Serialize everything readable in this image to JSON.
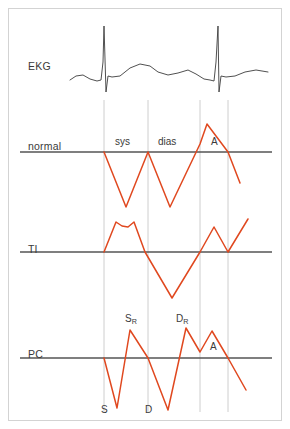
{
  "figure": {
    "width": 290,
    "height": 429,
    "background": "#ffffff",
    "frame_color": "#d3d3d3",
    "baseline_color": "#555555",
    "gridline_color": "#c8c8c8",
    "ekg_color": "#3c3c3c",
    "trace_color": "#e0481f"
  },
  "rows": [
    {
      "id": "ekg",
      "label": "EKG",
      "label_x": 28,
      "label_y": 60,
      "baseline_y": 0
    },
    {
      "id": "normal",
      "label": "normal",
      "label_x": 28,
      "label_y": 140,
      "baseline_y": 152
    },
    {
      "id": "ti",
      "label": "TI",
      "label_x": 28,
      "label_y": 243,
      "baseline_y": 252
    },
    {
      "id": "pc",
      "label": "PC",
      "label_x": 28,
      "label_y": 348,
      "baseline_y": 358
    }
  ],
  "gridlines": {
    "x_positions": [
      104,
      148,
      200,
      228
    ],
    "y_top": 100,
    "y_bottom": 412
  },
  "annotations": [
    {
      "id": "normal-sys",
      "text": "sys",
      "x": 115,
      "y": 136,
      "row": "normal",
      "sub": ""
    },
    {
      "id": "normal-dias",
      "text": "dias",
      "x": 158,
      "y": 136,
      "row": "normal",
      "sub": ""
    },
    {
      "id": "normal-a",
      "text": "A",
      "x": 211,
      "y": 136,
      "row": "normal",
      "sub": ""
    },
    {
      "id": "pc-sr",
      "text": "S",
      "x": 125,
      "y": 313,
      "row": "pc",
      "sub": "R"
    },
    {
      "id": "pc-dr",
      "text": "D",
      "x": 176,
      "y": 313,
      "row": "pc",
      "sub": "R"
    },
    {
      "id": "pc-a",
      "text": "A",
      "x": 210,
      "y": 341,
      "row": "pc",
      "sub": ""
    },
    {
      "id": "axis-s",
      "text": "S",
      "x": 101,
      "y": 404,
      "row": "axis",
      "sub": ""
    },
    {
      "id": "axis-d",
      "text": "D",
      "x": 145,
      "y": 404,
      "row": "axis",
      "sub": ""
    }
  ],
  "chart_data": {
    "type": "line",
    "xlabel": "",
    "ylabel": "",
    "grid": true,
    "legend": "none",
    "x_gridlines": [
      104,
      148,
      200,
      228
    ],
    "series": [
      {
        "name": "EKG",
        "color": "#3c3c3c",
        "baseline_y": 78,
        "points": "70,80 76,76 83,75 90,79 97,81 101,80 103,62 104,26 106,92 108,76 112,77 120,76 130,68 140,64 150,66 158,72 168,75 178,73 188,70 196,74 204,79 210,80 214,81 216,62 218,26 219,92 221,76 226,77 235,76 245,72 256,70 268,72"
      },
      {
        "name": "normal",
        "color": "#e0481f",
        "baseline_y": 152,
        "points": "104,152 126,207 148,152 170,207 200,144 207,124 228,152 240,183"
      },
      {
        "name": "TI",
        "color": "#e0481f",
        "baseline_y": 252,
        "points": "104,252 116,222 122,226 128,227 134,222 145,252 172,298 200,252 214,227 228,252 248,219"
      },
      {
        "name": "PC",
        "color": "#e0481f",
        "baseline_y": 358,
        "points": "104,358 117,408 130,330 148,358 168,410 186,328 200,352 212,331 228,358 246,390"
      }
    ],
    "annotations": [
      {
        "label": "sys",
        "series": "normal",
        "kind": "interval-label"
      },
      {
        "label": "dias",
        "series": "normal",
        "kind": "interval-label"
      },
      {
        "label": "A",
        "series": "normal",
        "kind": "peak-label"
      },
      {
        "label": "SR",
        "series": "PC",
        "kind": "peak-label"
      },
      {
        "label": "DR",
        "series": "PC",
        "kind": "peak-label"
      },
      {
        "label": "A",
        "series": "PC",
        "kind": "peak-label"
      },
      {
        "label": "S",
        "series": "PC",
        "kind": "trough-label"
      },
      {
        "label": "D",
        "series": "PC",
        "kind": "trough-label"
      }
    ]
  }
}
